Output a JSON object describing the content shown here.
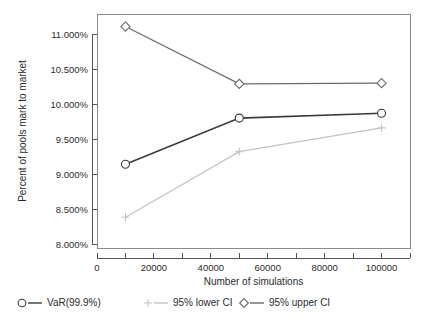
{
  "chart_data": {
    "type": "line",
    "title": "",
    "xlabel": "Number of simulations",
    "ylabel": "Percent of pools mark to market",
    "x": [
      10000,
      50000,
      100000
    ],
    "xlim": [
      0,
      110000
    ],
    "ylim": [
      7.95,
      11.3
    ],
    "grid": false,
    "legend_position": "bottom",
    "xticks": [
      0,
      20000,
      40000,
      60000,
      80000,
      100000
    ],
    "xtick_labels": [
      "0",
      "20000",
      "40000",
      "60000",
      "80000",
      "100000"
    ],
    "xminor_ticks": [
      10000,
      30000,
      50000,
      70000,
      90000,
      110000
    ],
    "yticks": [
      8.0,
      8.5,
      9.0,
      9.5,
      10.0,
      10.5,
      11.0
    ],
    "ytick_labels": [
      "8.000%",
      "8.500%",
      "9.000%",
      "9.500%",
      "10.000%",
      "10.500%",
      "11.000%"
    ],
    "series": [
      {
        "name": "VaR(99.9%)",
        "marker": "circle",
        "color": "#3a3a3a",
        "line_width": 1.6,
        "values": [
          9.15,
          9.81,
          9.88
        ]
      },
      {
        "name": "95% lower CI",
        "marker": "plus",
        "color": "#c3c3c3",
        "line_width": 1.2,
        "values": [
          8.39,
          9.33,
          9.67
        ]
      },
      {
        "name": "95% upper CI",
        "marker": "diamond",
        "color": "#6b6b6b",
        "line_width": 1.2,
        "values": [
          11.12,
          10.3,
          10.31
        ]
      }
    ]
  },
  "legend": {
    "items": [
      {
        "label": "VaR(99.9%)",
        "marker": "circle",
        "color": "#3a3a3a"
      },
      {
        "label": "95% lower CI",
        "marker": "plus",
        "color": "#c3c3c3"
      },
      {
        "label": "95% upper CI",
        "marker": "diamond",
        "color": "#6b6b6b"
      }
    ]
  }
}
